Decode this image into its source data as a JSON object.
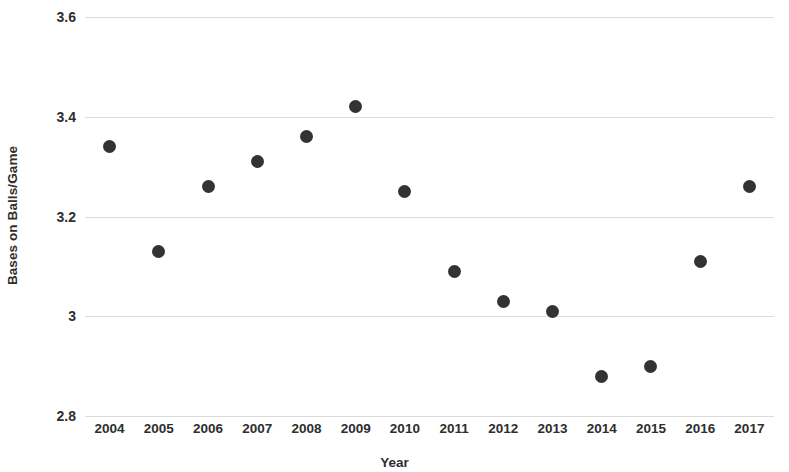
{
  "chart_data": {
    "type": "scatter",
    "title": "",
    "xlabel": "Year",
    "ylabel": "Bases on Balls/Game",
    "categories": [
      "2004",
      "2005",
      "2006",
      "2007",
      "2008",
      "2009",
      "2010",
      "2011",
      "2012",
      "2013",
      "2014",
      "2015",
      "2016",
      "2017"
    ],
    "x": [
      2004,
      2005,
      2006,
      2007,
      2008,
      2009,
      2010,
      2011,
      2012,
      2013,
      2014,
      2015,
      2016,
      2017
    ],
    "values": [
      3.34,
      3.13,
      3.26,
      3.31,
      3.36,
      3.42,
      3.25,
      3.09,
      3.03,
      3.01,
      2.88,
      2.9,
      3.11,
      3.26
    ],
    "ylim": [
      2.8,
      3.6
    ],
    "yticks": [
      2.8,
      3.0,
      3.2,
      3.4,
      3.6
    ],
    "ytick_labels": [
      "2.8",
      "3",
      "3.2",
      "3.4",
      "3.6"
    ],
    "xtick_labels": [
      "2004",
      "2005",
      "2006",
      "2007",
      "2008",
      "2009",
      "2010",
      "2011",
      "2012",
      "2013",
      "2014",
      "2015",
      "2016",
      "2017"
    ],
    "grid": true,
    "legend": false,
    "legend_position": "none",
    "marker_color": "#333333",
    "gridline_color": "#dcdcdc",
    "background_color": "#ffffff"
  },
  "axes": {
    "y_title": "Bases on Balls/Game",
    "x_title": "Year"
  }
}
